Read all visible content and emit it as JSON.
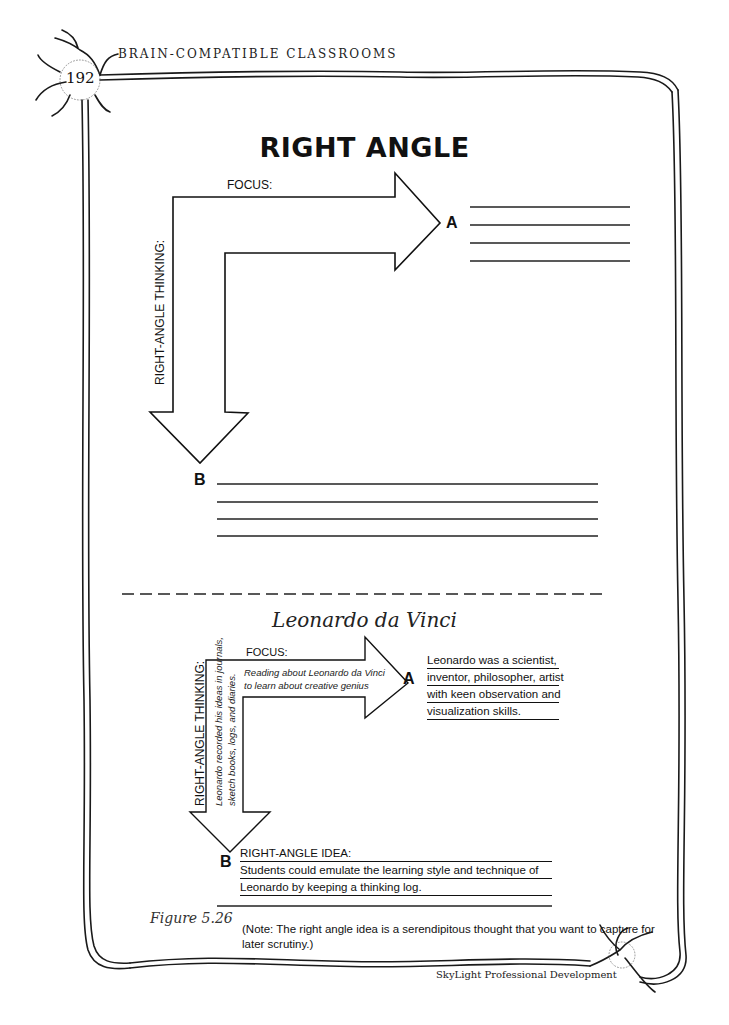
{
  "header": {
    "running_head": "BRAIN-COMPATIBLE CLASSROOMS",
    "page_number": "192"
  },
  "template": {
    "title": "RIGHT ANGLE",
    "focus_label": "FOCUS:",
    "thinking_label": "RIGHT-ANGLE THINKING:",
    "point_a": "A",
    "point_b": "B",
    "a_lines_count": 4,
    "b_lines_count": 4
  },
  "example": {
    "title": "Leonardo da Vinci",
    "focus_label": "FOCUS:",
    "focus_text_lines": [
      "Reading about Leonardo da Vinci",
      "to learn about creative genius"
    ],
    "thinking_label": "RIGHT-ANGLE THINKING:",
    "thinking_text_lines": [
      "Leonardo recorded his ideas in journals,",
      "sketch books, logs, and diaries."
    ],
    "point_a": "A",
    "a_lines": [
      "Leonardo was a scientist,",
      "inventor, philosopher, artist",
      "with keen observation and",
      "visualization skills."
    ],
    "point_b": "B",
    "b_lines": [
      "RIGHT-ANGLE IDEA:",
      "Students could emulate the learning style and technique of",
      "Leonardo by keeping a thinking log.",
      ""
    ]
  },
  "figure": {
    "caption": "Figure 5.26",
    "note": "(Note: The right angle idea is a serendipitous thought that you want to capture for later scrutiny.)"
  },
  "footer": {
    "publisher": "SkyLight Professional Development"
  },
  "colors": {
    "ink": "#111111",
    "paper": "#ffffff"
  }
}
